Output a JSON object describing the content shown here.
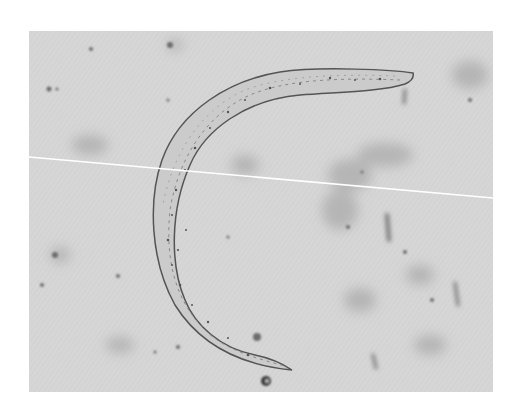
{
  "image": {
    "description": "Brightfield micrograph of a curved nematode worm on a mottled gray background",
    "background_color": "#ffffff",
    "photo_bg_color": "#d4d4d4",
    "worm_fill": "#cfcfcf",
    "worm_outline": "#5a5a5a",
    "scan_line_color": "#ffffff"
  }
}
